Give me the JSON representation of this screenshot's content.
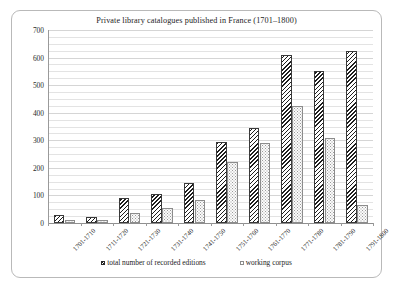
{
  "chart_data": {
    "type": "bar",
    "title": "Private library catalogues published in France (1701–1800)",
    "xlabel": "",
    "ylabel": "",
    "ylim": [
      0,
      700
    ],
    "y_major_step": 100,
    "y_minor_step": 25,
    "grid": true,
    "legend_position": "bottom",
    "categories": [
      "1701-1710",
      "1711-1720",
      "1721-1730",
      "1731-1740",
      "1741-1750",
      "1751-1760",
      "1761-1770",
      "1771-1780",
      "1781-1790",
      "1791-1800"
    ],
    "y_tick_labels": [
      "0",
      "100",
      "200",
      "300",
      "400",
      "500",
      "600",
      "700"
    ],
    "y_tick_values": [
      0,
      100,
      200,
      300,
      400,
      500,
      600,
      700
    ],
    "series": [
      {
        "name": "total number of recorded editions",
        "pattern": "diagonal-hatch",
        "values": [
          30,
          22,
          90,
          105,
          145,
          295,
          345,
          610,
          550,
          625
        ]
      },
      {
        "name": "working corpus",
        "pattern": "dotted",
        "values": [
          12,
          10,
          35,
          55,
          85,
          220,
          290,
          425,
          310,
          65
        ]
      }
    ]
  },
  "legend": {
    "items": [
      {
        "label": "total number of recorded editions"
      },
      {
        "label": "working corpus"
      }
    ]
  },
  "colors": {
    "frame_border": "#b9b9b9",
    "gridline_major": "#d5d5d5",
    "gridline_minor": "#e3e3e3",
    "axis": "#8f8f8f",
    "bar_total_stroke": "#2a2a2a",
    "bar_corpus_stroke": "#8c8c8c",
    "text": "#1d1d1d"
  }
}
